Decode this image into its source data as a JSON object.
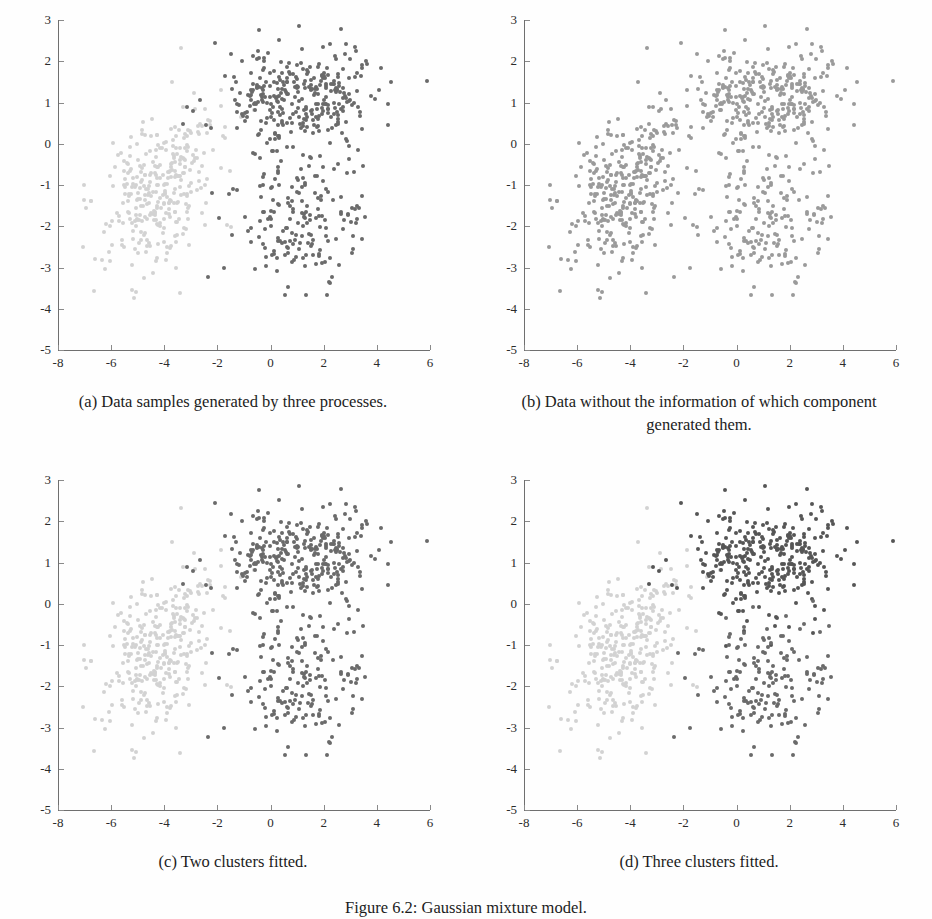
{
  "figure": {
    "caption": "Figure 6.2: Gaussian mixture model.",
    "panels": [
      {
        "id": "a",
        "caption": "(a) Data samples generated by three processes."
      },
      {
        "id": "b",
        "caption": "(b) Data without the information of which component generated them."
      },
      {
        "id": "c",
        "caption": "(c) Two clusters fitted."
      },
      {
        "id": "d",
        "caption": "(d) Three clusters fitted."
      }
    ]
  },
  "colors": {
    "cluster_light": "#d2d2d2",
    "cluster_mid": "#9a9a9a",
    "cluster_dark": "#6a6a6a",
    "axis": "#6f6f6f",
    "text": "#1c1c1c",
    "background": "#fefefe"
  },
  "chart_data": [
    {
      "type": "scatter",
      "title": "(a) Data samples generated by three processes.",
      "xlabel": "",
      "ylabel": "",
      "xlim": [
        -8,
        6
      ],
      "ylim": [
        -5,
        3
      ],
      "xticks": [
        -8,
        -6,
        -4,
        -2,
        0,
        2,
        4,
        6
      ],
      "yticks": [
        3,
        2,
        1,
        0,
        -1,
        -2,
        -3,
        -4,
        -5
      ],
      "grid": false,
      "legend": "none",
      "series": [
        {
          "name": "component-1-light",
          "color": "#d2d2d2",
          "n": 330,
          "center": [
            -4.1,
            -1.0
          ],
          "sigma": [
            1.15,
            1.0
          ],
          "rho": 0.45
        },
        {
          "name": "component-2-dark",
          "color": "#6a6a6a",
          "n": 330,
          "center": [
            1.1,
            1.1
          ],
          "sigma": [
            1.5,
            0.75
          ],
          "rho": 0.15
        },
        {
          "name": "component-3-dark",
          "color": "#6a6a6a",
          "n": 170,
          "center": [
            1.0,
            -1.9
          ],
          "sigma": [
            1.25,
            0.8
          ],
          "rho": 0.1
        }
      ]
    },
    {
      "type": "scatter",
      "title": "(b) Data without the information of which component generated them.",
      "xlabel": "",
      "ylabel": "",
      "xlim": [
        -8,
        6
      ],
      "ylim": [
        -5,
        3
      ],
      "xticks": [
        -8,
        -6,
        -4,
        -2,
        0,
        2,
        4,
        6
      ],
      "yticks": [
        3,
        2,
        1,
        0,
        -1,
        -2,
        -3,
        -4,
        -5
      ],
      "grid": false,
      "legend": "none",
      "series": [
        {
          "name": "unlabeled-1",
          "color": "#9a9a9a",
          "n": 330,
          "center": [
            -4.1,
            -1.0
          ],
          "sigma": [
            1.15,
            1.0
          ],
          "rho": 0.45
        },
        {
          "name": "unlabeled-2",
          "color": "#9a9a9a",
          "n": 330,
          "center": [
            1.1,
            1.1
          ],
          "sigma": [
            1.5,
            0.75
          ],
          "rho": 0.15
        },
        {
          "name": "unlabeled-3",
          "color": "#9a9a9a",
          "n": 170,
          "center": [
            1.0,
            -1.9
          ],
          "sigma": [
            1.25,
            0.8
          ],
          "rho": 0.1
        }
      ]
    },
    {
      "type": "scatter",
      "title": "(c) Two clusters fitted.",
      "xlabel": "",
      "ylabel": "",
      "xlim": [
        -8,
        6
      ],
      "ylim": [
        -5,
        3
      ],
      "xticks": [
        -8,
        -6,
        -4,
        -2,
        0,
        2,
        4,
        6
      ],
      "yticks": [
        3,
        2,
        1,
        0,
        -1,
        -2,
        -3,
        -4,
        -5
      ],
      "grid": false,
      "legend": "none",
      "series": [
        {
          "name": "cluster-1-light",
          "color": "#d2d2d2",
          "n": 330,
          "center": [
            -4.1,
            -1.0
          ],
          "sigma": [
            1.15,
            1.0
          ],
          "rho": 0.45
        },
        {
          "name": "cluster-2-dark",
          "color": "#6a6a6a",
          "n": 330,
          "center": [
            1.1,
            1.1
          ],
          "sigma": [
            1.5,
            0.75
          ],
          "rho": 0.15
        },
        {
          "name": "cluster-2-dark-lower",
          "color": "#6a6a6a",
          "n": 170,
          "center": [
            1.0,
            -1.9
          ],
          "sigma": [
            1.25,
            0.8
          ],
          "rho": 0.1
        }
      ]
    },
    {
      "type": "scatter",
      "title": "(d) Three clusters fitted.",
      "xlabel": "",
      "ylabel": "",
      "xlim": [
        -8,
        6
      ],
      "ylim": [
        -5,
        3
      ],
      "xticks": [
        -8,
        -6,
        -4,
        -2,
        0,
        2,
        4,
        6
      ],
      "yticks": [
        3,
        2,
        1,
        0,
        -1,
        -2,
        -3,
        -4,
        -5
      ],
      "grid": false,
      "legend": "none",
      "series": [
        {
          "name": "cluster-1-light",
          "color": "#d2d2d2",
          "n": 330,
          "center": [
            -4.1,
            -1.0
          ],
          "sigma": [
            1.15,
            1.0
          ],
          "rho": 0.45
        },
        {
          "name": "cluster-2-dark",
          "color": "#555555",
          "n": 330,
          "center": [
            1.1,
            1.1
          ],
          "sigma": [
            1.5,
            0.75
          ],
          "rho": 0.15
        },
        {
          "name": "cluster-3-dark",
          "color": "#6a6a6a",
          "n": 170,
          "center": [
            1.0,
            -1.9
          ],
          "sigma": [
            1.25,
            0.8
          ],
          "rho": 0.1
        }
      ]
    }
  ]
}
